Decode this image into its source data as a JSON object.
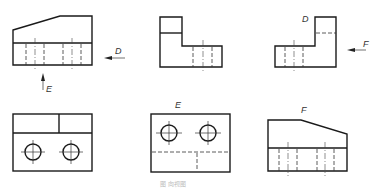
{
  "figure": {
    "type": "engineering orthographic views with direction (auxiliary) views",
    "caption": "图 向视图",
    "views": [
      {
        "id": "main-view",
        "position": "top-left",
        "arrows": [
          {
            "label": "D",
            "direction": "left"
          },
          {
            "label": "E",
            "direction": "up"
          }
        ]
      },
      {
        "id": "left-view",
        "position": "top-center"
      },
      {
        "id": "view-D",
        "position": "top-right",
        "label": "D",
        "arrows": [
          {
            "label": "F",
            "direction": "left"
          }
        ]
      },
      {
        "id": "top-view",
        "position": "bottom-left"
      },
      {
        "id": "view-E",
        "position": "bottom-center",
        "label": "E"
      },
      {
        "id": "view-F",
        "position": "bottom-right",
        "label": "F"
      }
    ]
  },
  "labels": {
    "arrow_d": "D",
    "arrow_e": "E",
    "arrow_f": "F",
    "view_d": "D",
    "view_e": "E",
    "view_f": "F",
    "caption": "图  向视图"
  },
  "colors": {
    "line": "#1a1a1a",
    "background": "#ffffff"
  }
}
